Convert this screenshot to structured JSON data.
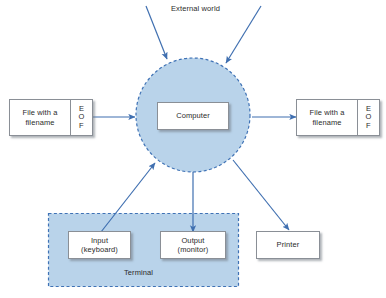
{
  "diagram": {
    "colors": {
      "circle_fill": "#b9d3ea",
      "circle_stroke": "#3f72b5",
      "terminal_fill": "#b9d3ea",
      "terminal_stroke": "#3f72b5",
      "arrow": "#3f6fb0",
      "box_border": "#8a8f96",
      "box_fill": "#ffffff",
      "text": "#2b2b2b",
      "page_background": "#ffffff"
    },
    "labels": {
      "external_world": "External world",
      "terminal": "Terminal"
    },
    "nodes": {
      "computer": {
        "label": "Computer"
      },
      "file_in": {
        "body": "File with a\nfilename",
        "eof": "E\nO\nF"
      },
      "file_out": {
        "body": "File with a\nfilename",
        "eof": "E\nO\nF"
      },
      "input_keyboard": {
        "label": "Input\n(keyboard)"
      },
      "output_monitor": {
        "label": "Output\n(monitor)"
      },
      "printer": {
        "label": "Printer"
      }
    },
    "edges": [
      {
        "name": "external-world-left-to-computer",
        "from": "External world",
        "to": "Computer",
        "direction": "in"
      },
      {
        "name": "external-world-right-to-computer",
        "from": "External world",
        "to": "Computer",
        "direction": "in"
      },
      {
        "name": "file-in-to-computer",
        "from": "File with a filename",
        "to": "Computer",
        "direction": "in"
      },
      {
        "name": "computer-to-file-out",
        "from": "Computer",
        "to": "File with a filename",
        "direction": "out"
      },
      {
        "name": "input-keyboard-to-computer",
        "from": "Input (keyboard)",
        "to": "Computer",
        "direction": "in"
      },
      {
        "name": "computer-to-output-monitor",
        "from": "Computer",
        "to": "Output (monitor)",
        "direction": "out"
      },
      {
        "name": "computer-to-printer",
        "from": "Computer",
        "to": "Printer",
        "direction": "out"
      }
    ]
  }
}
